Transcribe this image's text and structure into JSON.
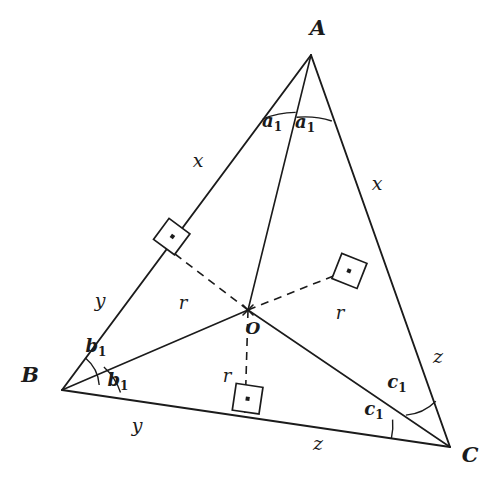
{
  "figure": {
    "type": "geometry-diagram",
    "background_color": "#ffffff",
    "stroke_color": "#1b1b1b"
  },
  "vertices": [
    {
      "id": "A",
      "label": "A",
      "x": 311,
      "y": 55,
      "label_x": 318,
      "label_y": 35
    },
    {
      "id": "B",
      "label": "B",
      "x": 62,
      "y": 390,
      "label_x": 30,
      "label_y": 382
    },
    {
      "id": "C",
      "label": "C",
      "x": 450,
      "y": 447,
      "label_x": 470,
      "label_y": 462
    }
  ],
  "incenter": {
    "id": "O",
    "label": "O",
    "x": 248,
    "y": 310,
    "label_x": 253,
    "label_y": 334
  },
  "touch_points": [
    {
      "id": "F_AB",
      "side": "AB",
      "x": 175,
      "y": 254
    },
    {
      "id": "F_AC",
      "side": "AC",
      "x": 366,
      "y": 263
    },
    {
      "id": "F_BC",
      "side": "BC",
      "x": 245,
      "y": 413
    }
  ],
  "side_labels": [
    {
      "name": "segment-a-upper-left",
      "text": "x",
      "x": 198,
      "y": 167
    },
    {
      "name": "segment-a-upper-right",
      "text": "x",
      "x": 377,
      "y": 190
    },
    {
      "name": "segment-b-lower-left",
      "text": "y",
      "x": 100,
      "y": 307
    },
    {
      "name": "segment-b-bottom-left",
      "text": "y",
      "x": 137,
      "y": 432
    },
    {
      "name": "segment-c-lower-right",
      "text": "z",
      "x": 438,
      "y": 363
    },
    {
      "name": "segment-c-bottom-right",
      "text": "z",
      "x": 318,
      "y": 450
    }
  ],
  "radius_labels": [
    {
      "name": "radius-left",
      "text": "r",
      "x": 183,
      "y": 309
    },
    {
      "name": "radius-right",
      "text": "r",
      "x": 340,
      "y": 319
    },
    {
      "name": "radius-bottom",
      "text": "r",
      "x": 227,
      "y": 382
    }
  ],
  "angle_labels": [
    {
      "name": "angle-a1-left",
      "base": "a",
      "sub": "1",
      "x": 272,
      "y": 127
    },
    {
      "name": "angle-a1-right",
      "base": "a",
      "sub": "1",
      "x": 305,
      "y": 128
    },
    {
      "name": "angle-b1-upper",
      "base": "b",
      "sub": "1",
      "x": 96,
      "y": 352
    },
    {
      "name": "angle-b1-lower",
      "base": "b",
      "sub": "1",
      "x": 118,
      "y": 386
    },
    {
      "name": "angle-c1-upper",
      "base": "c",
      "sub": "1",
      "x": 397,
      "y": 388
    },
    {
      "name": "angle-c1-lower",
      "base": "c",
      "sub": "1",
      "x": 374,
      "y": 415
    }
  ],
  "legend": {
    "x": "tangent length from vertex A",
    "y": "tangent length from vertex B",
    "z": "tangent length from vertex C",
    "r": "inradius",
    "O": "incenter"
  }
}
